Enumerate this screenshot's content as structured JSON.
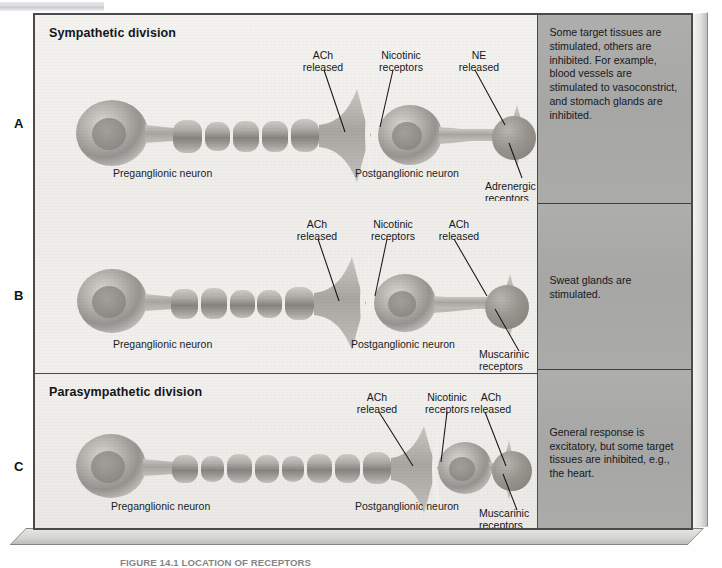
{
  "figure": {
    "caption": "FIGURE 14.1 LOCATION OF RECEPTORS"
  },
  "rows": [
    {
      "letter": "A",
      "title": "Sympathetic division",
      "preganglionic_label": "Preganglionic neuron",
      "postganglionic_label": "Postganglionic neuron",
      "callouts": [
        {
          "name": "ach-released",
          "text": "ACh\nreleased"
        },
        {
          "name": "nicotinic-receptors",
          "text": "Nicotinic\nreceptors"
        },
        {
          "name": "ne-released",
          "text": "NE\nreleased"
        },
        {
          "name": "adrenergic-receptors",
          "text": "Adrenergic\nreceptors"
        }
      ],
      "effect": "Some target tissues are stimulated, others are inhibited. For example, blood vessels are stimulated to vasoconstrict, and stomach glands are inhibited."
    },
    {
      "letter": "B",
      "title": "",
      "preganglionic_label": "Preganglionic neuron",
      "postganglionic_label": "Postganglionic neuron",
      "callouts": [
        {
          "name": "ach-released",
          "text": "ACh\nreleased"
        },
        {
          "name": "nicotinic-receptors",
          "text": "Nicotinic\nreceptors"
        },
        {
          "name": "ach-released-2",
          "text": "ACh\nreleased"
        },
        {
          "name": "muscarinic-receptors",
          "text": "Muscarinic\nreceptors"
        }
      ],
      "effect": "Sweat glands are stimulated."
    },
    {
      "letter": "C",
      "title": "Parasympathetic division",
      "preganglionic_label": "Preganglionic neuron",
      "postganglionic_label": "Postganglionic neuron",
      "callouts": [
        {
          "name": "ach-released",
          "text": "ACh\nreleased"
        },
        {
          "name": "nicotinic-receptors",
          "text": "Nicotinic\nreceptors"
        },
        {
          "name": "ach-released-2",
          "text": "ACh\nreleased"
        },
        {
          "name": "muscarinic-receptors",
          "text": "Muscarinic\nreceptors"
        }
      ],
      "effect": "General response is excitatory, but some target tissues are inhibited, e.g., the heart."
    }
  ],
  "colors": {
    "board_background": "#f2f1ee",
    "effects_background": "#a9a9a7",
    "border": "#4a4a48",
    "text": "#16181e",
    "neuron_light": "#cfcdc9",
    "neuron_mid": "#a8a5a0",
    "neuron_dark": "#8a8782"
  }
}
